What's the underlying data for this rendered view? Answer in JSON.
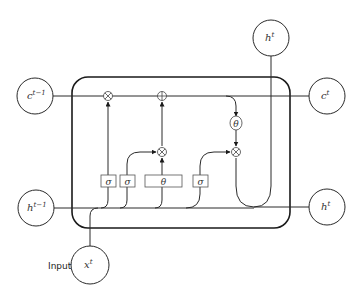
{
  "diagram": {
    "nodes": {
      "c_prev": {
        "base": "c",
        "sup": "t−1"
      },
      "c_next": {
        "base": "c",
        "sup": "t"
      },
      "h_prev": {
        "base": "h",
        "sup": "t−1"
      },
      "h_out_top": {
        "base": "h",
        "sup": "t"
      },
      "h_out_right": {
        "base": "h",
        "sup": "t"
      },
      "x_in": {
        "base": "x",
        "sup": "t"
      }
    },
    "input_label": "Input",
    "gates": [
      {
        "id": "forget",
        "symbol": "σ"
      },
      {
        "id": "input",
        "symbol": "σ"
      },
      {
        "id": "candidate",
        "symbol": "θ"
      },
      {
        "id": "output",
        "symbol": "σ"
      }
    ],
    "ops": {
      "forget_mult": "⊗",
      "cell_add": "⊕",
      "input_mult": "⊗",
      "output_mult": "⊗",
      "cell_tanh": "θ"
    },
    "colors": {
      "stroke": "#2a2a2a",
      "background": "#ffffff"
    }
  }
}
